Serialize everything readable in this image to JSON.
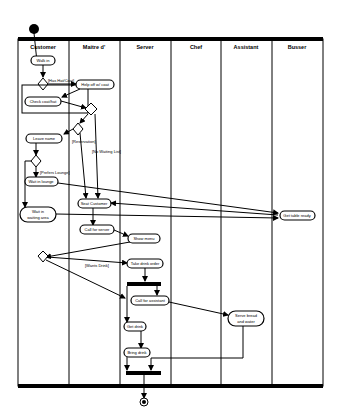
{
  "diagram": {
    "type": "UML activity diagram with swimlanes",
    "lanes": [
      {
        "name": "Customer"
      },
      {
        "name": "Maitre d'"
      },
      {
        "name": "Server"
      },
      {
        "name": "Chef"
      },
      {
        "name": "Assistant"
      },
      {
        "name": "Busser"
      }
    ],
    "activities": {
      "walk_in": "Walk in",
      "help_coat": "Help off w/ coat",
      "check_coat": "Check coat/hat",
      "leave_name": "Leave name",
      "wait_lounge": "Wait in lounge",
      "wait_area_1": "Wait in",
      "wait_area_2": "waiting area",
      "seat_customer": "Seat Customer",
      "get_table_ready": "Get table ready",
      "call_server": "Call for server",
      "show_menu": "Show menu",
      "take_drink": "Take drink order",
      "call_assistant": "Call for assistant",
      "serve_bread_1": "Serve bread",
      "serve_bread_2": "and water",
      "get_drink": "Get drink",
      "bring_drink": "Bring drink"
    },
    "guards": {
      "has_hat": "[Has Hat/Coat]",
      "reservation": "[Reservation]",
      "no_waiting": "[No Waiting List]",
      "prefers_lounge": "[Prefers Lounge]",
      "wants_drink": "[Wants Drink]"
    }
  }
}
